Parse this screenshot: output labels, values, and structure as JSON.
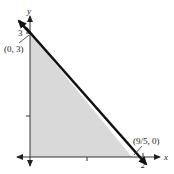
{
  "diagram": {
    "type": "graph-of-inequality-region",
    "axes": {
      "x_label": "x",
      "y_label": "y",
      "x_ticks": [
        1,
        2
      ],
      "y_ticks": [
        1,
        2,
        3
      ],
      "y_tick_label_shown": "3",
      "x_tick_label_shown": "2"
    },
    "line": {
      "description": "boundary line through (0, 3) and (9/5, 0)",
      "color": "#111111"
    },
    "region": {
      "description": "shaded triangle bounded by axes and line",
      "fill": "#d9d9d9"
    },
    "points": [
      {
        "label": "(0, 3)"
      },
      {
        "label": "(9/5, 0)"
      }
    ]
  }
}
